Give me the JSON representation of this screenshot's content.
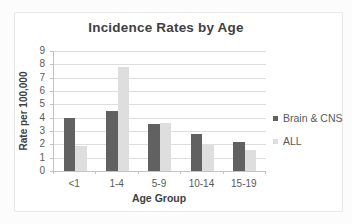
{
  "chart_data": {
    "type": "bar",
    "title": "Incidence Rates by Age",
    "xlabel": "Age Group",
    "ylabel": "Rate per 100,000",
    "categories": [
      "<1",
      "1-4",
      "5-9",
      "10-14",
      "15-19"
    ],
    "series": [
      {
        "name": "Brain & CNS",
        "color": "#616161",
        "values": [
          4.0,
          4.5,
          3.5,
          2.8,
          2.2
        ]
      },
      {
        "name": "ALL",
        "color": "#dedede",
        "values": [
          1.9,
          7.8,
          3.6,
          2.0,
          1.6
        ]
      }
    ],
    "ylim": [
      0,
      9
    ],
    "yticks": [
      0,
      1,
      2,
      3,
      4,
      5,
      6,
      7,
      8,
      9
    ],
    "grid": true,
    "legend_position": "right"
  },
  "style": {
    "bar_dark": "#616161",
    "bar_light": "#dedede",
    "gridline": "#dedede",
    "axis_line": "#c3c3c3",
    "tick_text": "#595959",
    "title_text": "#3f3f3f",
    "frame_border": "#e8e8e8",
    "background": "#ffffff"
  }
}
